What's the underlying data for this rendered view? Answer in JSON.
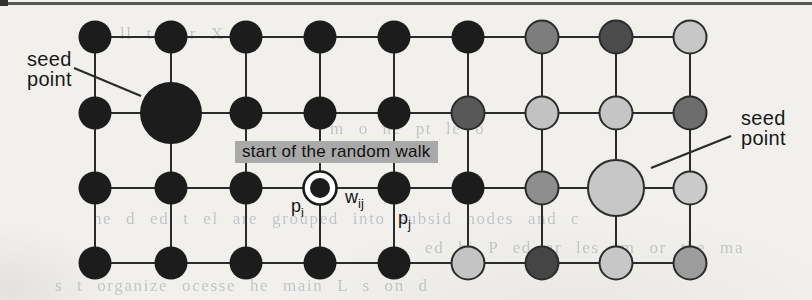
{
  "figure": {
    "background": "#f1f0ec",
    "top_rule_color": "#565656",
    "labels": {
      "seed_left": {
        "line1": "seed",
        "line2": "point",
        "x": 27,
        "y": 49
      },
      "seed_right": {
        "line1": "seed",
        "line2": "point",
        "x": 741,
        "y": 108
      },
      "start_walk": {
        "text": "start of the random walk",
        "x": 235,
        "y": 141,
        "bg": "#a9a9a9"
      },
      "p_i": {
        "base": "p",
        "sub": "i",
        "x": 291,
        "y": 196
      },
      "w_ij": {
        "base": "w",
        "sub": "ij",
        "x": 345,
        "y": 187
      },
      "p_j": {
        "base": "p",
        "sub": "j",
        "x": 398,
        "y": 208
      }
    },
    "graph": {
      "cols_x": [
        95,
        171,
        246,
        320,
        394,
        468,
        542,
        616,
        690
      ],
      "rows_y": [
        37,
        113,
        188,
        263
      ],
      "node_radius": 16.5,
      "edge_color": "#2b2b2b",
      "edge_width": 2,
      "node_stroke": "#2b2b2b",
      "node_stroke_width": 2,
      "black": "#1c1c1c",
      "grid_colors": [
        [
          "#1c1c1c",
          "#1c1c1c",
          "#1c1c1c",
          "#1c1c1c",
          "#1c1c1c",
          "#1c1c1c",
          "#7d7d7d",
          "#4b4b4b",
          "#c7c7c7"
        ],
        [
          "#1c1c1c",
          "#1c1c1c",
          "#1c1c1c",
          "#1c1c1c",
          "#1c1c1c",
          "#585858",
          "#c2c2c2",
          "#c5c5c5",
          "#6d6d6d"
        ],
        [
          "#1c1c1c",
          "#1c1c1c",
          "#1c1c1c",
          "#1c1c1c",
          "#1c1c1c",
          "#1c1c1c",
          "#8e8e8e",
          "#c7c7c7",
          "#cacaca"
        ],
        [
          "#1c1c1c",
          "#1c1c1c",
          "#1c1c1c",
          "#1c1c1c",
          "#1c1c1c",
          "#c4c4c4",
          "#454545",
          "#c7c7c7",
          "#9c9c9c"
        ]
      ],
      "special_nodes": [
        {
          "row": 2,
          "col": 2,
          "type": "seed-large",
          "radius": 31
        },
        {
          "row": 3,
          "col": 8,
          "type": "seed-large",
          "radius": 28
        },
        {
          "row": 3,
          "col": 4,
          "type": "start-ring",
          "outer_radius": 16.5,
          "inner_radius": 10,
          "ring_fill": "#ffffff"
        }
      ],
      "pointer_lines": [
        {
          "name": "seed-pointer-line-left",
          "x1": 74,
          "y1": 68,
          "x2": 141,
          "y2": 96
        },
        {
          "name": "seed-pointer-line-right",
          "x1": 731,
          "y1": 136,
          "x2": 651,
          "y2": 168
        }
      ]
    },
    "bleedthrough": [
      {
        "x": 120,
        "y": 24,
        "text": "ll t c   r X o"
      },
      {
        "x": 330,
        "y": 119,
        "text": "m o   ne pt   le o"
      },
      {
        "x": 93,
        "y": 209,
        "text": "he d   ed t el   are grouped into subsid   nodes and c"
      },
      {
        "x": 425,
        "y": 238,
        "text": "ed hi P   ed ar les   rm   or tbe ma"
      },
      {
        "x": 55,
        "y": 276,
        "text": "s   t   organize   ocesse    he main   L   s   on   d"
      }
    ]
  }
}
